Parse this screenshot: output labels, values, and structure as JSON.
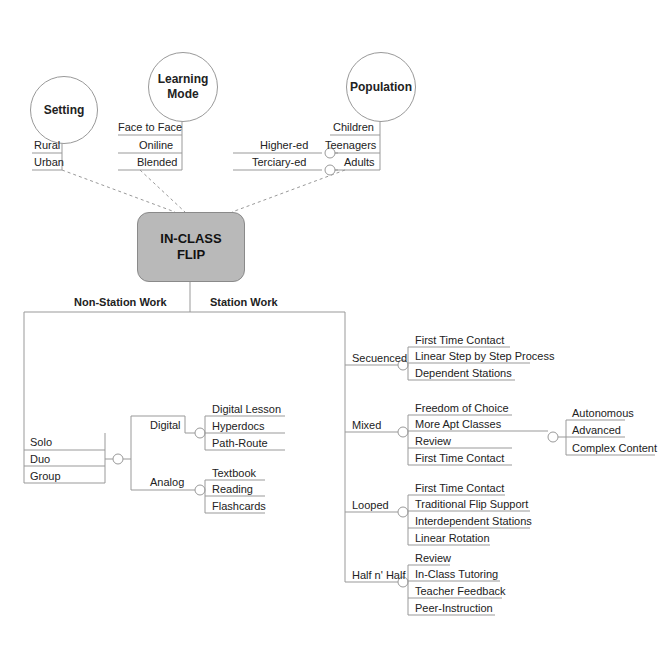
{
  "diagram": {
    "title": "IN-CLASS\nFLIP",
    "title_line1": "IN-CLASS",
    "title_line2": "FLIP",
    "top_categories": [
      {
        "label": "Setting",
        "items": [
          "Rural",
          "Urban"
        ]
      },
      {
        "label_line1": "Learning",
        "label_line2": "Mode",
        "items": [
          "Face to Face",
          "Oniline",
          "Blended"
        ]
      },
      {
        "label": "Population",
        "items": [
          "Children",
          "Teenagers",
          "Adults"
        ],
        "sub_items": [
          "Higher-ed",
          "Terciary-ed"
        ]
      }
    ],
    "branches": {
      "non_station": {
        "label": "Non-Station Work",
        "grouping": [
          "Solo",
          "Duo",
          "Group"
        ],
        "modes": [
          {
            "label": "Digital",
            "items": [
              "Digital Lesson",
              "Hyperdocs",
              "Path-Route"
            ]
          },
          {
            "label": "Analog",
            "items": [
              "Textbook",
              "Reading",
              "Flashcards"
            ]
          }
        ]
      },
      "station": {
        "label": "Station Work",
        "types": [
          {
            "label": "Secuenced",
            "items": [
              "First Time Contact",
              "Linear Step by Step Process",
              "Dependent Stations"
            ]
          },
          {
            "label": "Mixed",
            "items": [
              "Freedom of Choice",
              "More Apt Classes",
              "Review",
              "First Time Contact"
            ],
            "sub_items": [
              "Autonomous",
              "Advanced",
              "Complex Content"
            ]
          },
          {
            "label": "Looped",
            "items": [
              "First Time Contact",
              "Traditional Flip Support",
              "Interdependent Stations",
              "Linear Rotation"
            ]
          },
          {
            "label": "Half n' Half",
            "items": [
              "Review",
              "In-Class Tutoring",
              "Teacher Feedback",
              "Peer-Instruction"
            ]
          }
        ]
      }
    },
    "colors": {
      "center_fill": "#b9b9b9",
      "line": "#999999",
      "text": "#222222"
    }
  }
}
